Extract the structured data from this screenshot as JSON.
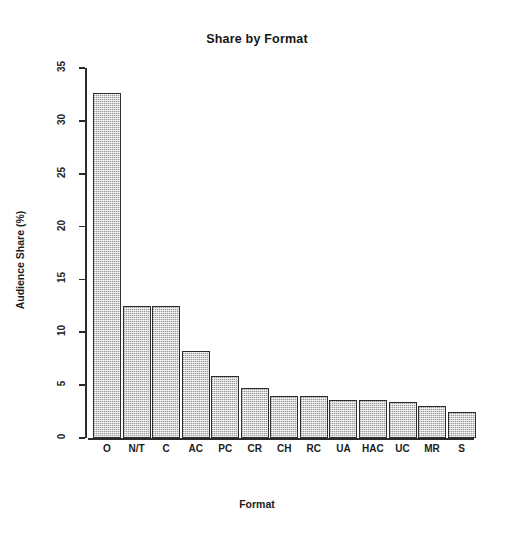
{
  "chart_data": {
    "type": "bar",
    "title": "Share by Format",
    "xlabel": "Format",
    "ylabel": "Audience Share (%)",
    "categories": [
      "O",
      "N/T",
      "C",
      "AC",
      "PC",
      "CR",
      "CH",
      "RC",
      "UA",
      "HAC",
      "UC",
      "MR",
      "S"
    ],
    "values": [
      32.6,
      12.5,
      12.5,
      8.2,
      5.9,
      4.7,
      4.0,
      4.0,
      3.6,
      3.6,
      3.4,
      3.0,
      2.5
    ],
    "ylim": [
      0,
      35
    ],
    "yticks": [
      0,
      5,
      10,
      15,
      20,
      25,
      30,
      35
    ],
    "grid": false,
    "legend": false,
    "bar_fill_color": "#c0c0c0",
    "bar_border_color": "#2e2e2e",
    "background_color": "#ffffff"
  }
}
